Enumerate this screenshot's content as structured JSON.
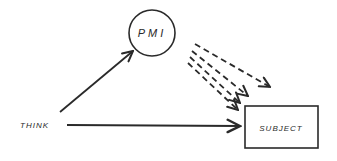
{
  "diagram": {
    "nodes": {
      "pmi": {
        "label": "PMI",
        "shape": "circle"
      },
      "think": {
        "label": "THINK",
        "shape": "text"
      },
      "subject": {
        "label": "SUBJECT",
        "shape": "rectangle"
      }
    },
    "edges": [
      {
        "from": "THINK",
        "to": "PMI",
        "style": "solid"
      },
      {
        "from": "THINK",
        "to": "SUBJECT",
        "style": "solid"
      },
      {
        "from": "PMI",
        "to": "SUBJECT",
        "style": "dashed",
        "count": 4
      }
    ],
    "colors": {
      "ink": "#2a2a2a",
      "background": "#ffffff"
    }
  }
}
